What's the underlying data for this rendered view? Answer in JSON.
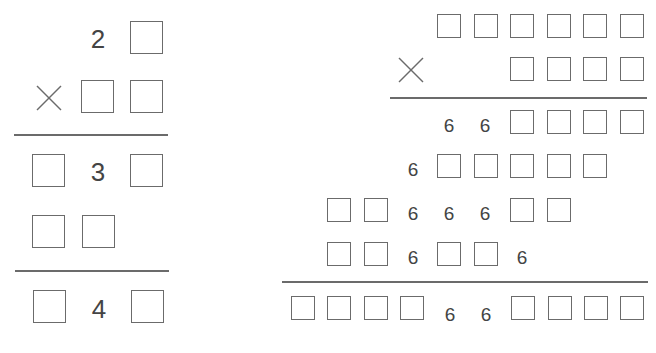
{
  "puzzle_left": {
    "rows": [
      {
        "cells": [
          "",
          "",
          "2",
          "box"
        ]
      },
      {
        "cells": [
          "times",
          "",
          "box",
          "box"
        ]
      },
      {
        "cells": [
          "box",
          "",
          "3",
          "box"
        ]
      },
      {
        "cells": [
          "box",
          "box",
          "",
          ""
        ]
      },
      {
        "cells": [
          "box",
          "",
          "4",
          "box"
        ]
      }
    ],
    "digits": {
      "r1": "2",
      "r3": "3",
      "r5": "4"
    },
    "operator": "×"
  },
  "puzzle_right": {
    "rows": [
      {
        "cells": [
          "box",
          "box",
          "box",
          "box",
          "box",
          "box"
        ]
      },
      {
        "cells": [
          "times",
          "box",
          "box",
          "box",
          "box"
        ]
      },
      {
        "cells": [
          "6",
          "6",
          "box",
          "box",
          "box",
          "box"
        ]
      },
      {
        "cells": [
          "6",
          "box",
          "box",
          "box",
          "box",
          "box"
        ]
      },
      {
        "cells": [
          "box",
          "box",
          "6",
          "6",
          "6",
          "box",
          "box"
        ]
      },
      {
        "cells": [
          "box",
          "box",
          "6",
          "box",
          "box",
          "6"
        ]
      },
      {
        "cells": [
          "box",
          "box",
          "box",
          "box",
          "6",
          "6",
          "box",
          "box",
          "box",
          "box"
        ]
      }
    ],
    "digit": "6",
    "operator": "×"
  },
  "colors": {
    "stroke": "#6b6b6b",
    "text": "#444444",
    "background": "#ffffff"
  }
}
